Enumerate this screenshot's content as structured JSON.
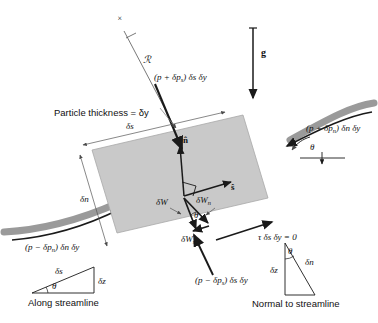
{
  "figure": {
    "colors": {
      "particle_fill": "#c9c9c9",
      "particle_stroke": "#8f8f8f",
      "streamline_band": "#9a9a9a",
      "arrow_black": "#1a1a1a",
      "thin_line": "#555555",
      "text": "#111111"
    }
  },
  "labels": {
    "radius_of_curvature": "ℛ",
    "center_mark": "×",
    "gravity": "g",
    "particle_thickness": "Particle thickness = δy",
    "pressure_top": "(p + δp",
    "pressure_top_sub": "s",
    "pressure_top_tail": ") δs δy",
    "pressure_right": "(p + δp",
    "pressure_right_sub": "n",
    "pressure_right_tail": ") δn δy",
    "pressure_left": "(p − δp",
    "pressure_left_sub": "n",
    "pressure_left_tail": ") δn δy",
    "pressure_bottom": "(p − δp",
    "pressure_bottom_sub": "s",
    "pressure_bottom_tail": ") δs δy",
    "shear_stress": "τ δs δy = 0",
    "edge_ds": "δs",
    "edge_dn": "δn",
    "unit_normal": "n̂",
    "unit_tangent": "ŝ",
    "weight_total": "δW",
    "weight_normal": "δW",
    "weight_normal_sub": "n",
    "weight_stream": "δW",
    "weight_stream_sub": "s",
    "theta_particle": "θ",
    "theta_right": "θ"
  },
  "triangles": {
    "along": {
      "caption": "Along streamline",
      "hypotenuse": "δs",
      "vertical": "δz",
      "angle": "θ"
    },
    "normal": {
      "caption": "Normal to streamline",
      "hypotenuse": "δn",
      "vertical": "δz",
      "angle": "θ"
    }
  }
}
